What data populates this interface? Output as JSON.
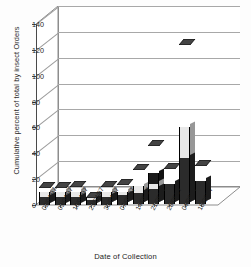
{
  "chart_data": {
    "type": "bar",
    "subtype": "3d-stacked-column",
    "title": "",
    "xlabel": "Date of Collection",
    "ylabel": "Cumulative percent of total by insect Orders",
    "ylim": [
      0,
      140
    ],
    "yticks": [
      0,
      20,
      40,
      60,
      80,
      100,
      120,
      140
    ],
    "grid": true,
    "legend": "none",
    "categories": [
      "02/04/97",
      "09/04/97",
      "16/04/97",
      "23/04/97",
      "30/04/97",
      "07/05/97",
      "14/05/97",
      "21/05/97",
      "28/05/97",
      "04/06/97",
      "18/06/97"
    ],
    "values": [
      20,
      20,
      20,
      12,
      20,
      22,
      33,
      52,
      34,
      130,
      36
    ],
    "series": [
      {
        "name": "lower segment",
        "color": "#1a1a1a",
        "values": [
          4,
          4,
          4,
          2,
          4,
          5,
          10,
          24,
          11,
          34,
          7
        ]
      },
      {
        "name": "middle segment",
        "color": "#e8e8e8",
        "values": [
          10,
          10,
          10,
          6,
          10,
          10,
          14,
          16,
          7,
          60,
          11
        ]
      },
      {
        "name": "upper segment",
        "color": "#2b2b2b",
        "values": [
          6,
          6,
          6,
          4,
          6,
          7,
          9,
          12,
          16,
          36,
          18
        ]
      }
    ]
  },
  "axis": {
    "y_title": "Cumulative percent of total by insect Orders",
    "x_title": "Date of Collection",
    "y_tick_labels": [
      "0",
      "20",
      "40",
      "60",
      "80",
      "100",
      "120",
      "140"
    ]
  }
}
